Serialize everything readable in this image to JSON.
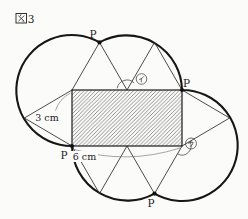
{
  "figure_label": {
    "kanji": "図",
    "number": "3",
    "full": "図3"
  },
  "point_label": "P",
  "dimension_labels": {
    "rect_height": "3 cm",
    "rect_width": "6 cm"
  },
  "angle_labels": {
    "first": "イ",
    "second": "ウ"
  },
  "shape_info": {
    "rectangle": "6 cm × 3 cm",
    "triangle_side_cm": 3,
    "p_positions": 4
  },
  "colors": {
    "ink": "#1c1c1c",
    "background": "#fbfbfa"
  }
}
